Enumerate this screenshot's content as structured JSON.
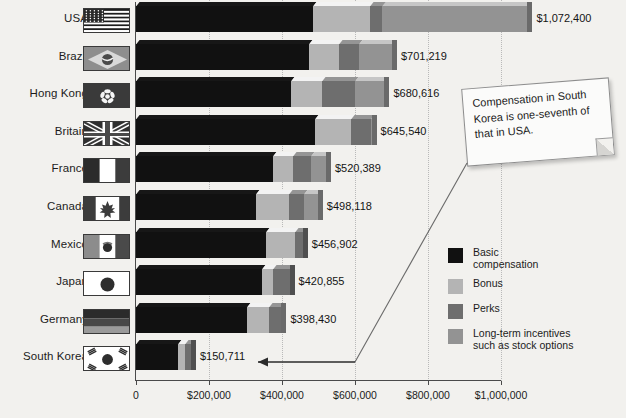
{
  "chart_data": {
    "type": "bar",
    "orientation": "horizontal",
    "stacked": true,
    "title": "",
    "xlabel": "",
    "ylabel": "",
    "xlim": [
      0,
      1000000
    ],
    "grid": true,
    "legend_position": "right",
    "xticks": [
      "0",
      "$200,000",
      "$400,000",
      "$600,000",
      "$800,000",
      "$1,000,000"
    ],
    "xtick_values": [
      0,
      200000,
      400000,
      600000,
      800000,
      1000000
    ],
    "categories": [
      "USA",
      "Brazil",
      "Hong Kong",
      "Britain",
      "France",
      "Canada",
      "Mexico",
      "Japan",
      "Germany",
      "South Korea"
    ],
    "totals": [
      1072400,
      701219,
      680616,
      645540,
      520389,
      498118,
      456902,
      420855,
      398430,
      150711
    ],
    "total_labels": [
      "$1,072,400",
      "$701,219",
      "$680,616",
      "$645,540",
      "$520,389",
      "$520,389",
      "$456,902",
      "$420,855",
      "$398,430",
      "$150,711"
    ],
    "value_labels": [
      "$1,072,400",
      "$701,219",
      "$680,616",
      "$645,540",
      "$520,389",
      "$498,118",
      "$456,902",
      "$420,855",
      "$398,430",
      "$150,711"
    ],
    "series": [
      {
        "name": "Basic compensation",
        "color": "#111111",
        "values": [
          485000,
          475000,
          425000,
          490000,
          375000,
          330000,
          355000,
          345000,
          305000,
          115000
        ]
      },
      {
        "name": "Bonus",
        "color": "#b4b4b4",
        "values": [
          155000,
          80000,
          85000,
          100000,
          55000,
          90000,
          80000,
          30000,
          60000,
          20000
        ]
      },
      {
        "name": "Perks",
        "color": "#6e6e6e",
        "values": [
          35000,
          55000,
          90000,
          55000,
          50000,
          40000,
          22000,
          46000,
          33000,
          16000
        ]
      },
      {
        "name": "Long-term incentives such as stock options",
        "color": "#939393",
        "values": [
          397400,
          91219,
          80616,
          540,
          40389,
          38118,
          0,
          0,
          430,
          0
        ]
      }
    ]
  },
  "legend": {
    "items": [
      {
        "label": "Basic\ncompensation",
        "label_line1": "Basic",
        "label_line2": "compensation",
        "color": "#111111"
      },
      {
        "label": "Bonus",
        "label_line1": "Bonus",
        "label_line2": "",
        "color": "#b4b4b4"
      },
      {
        "label": "Perks",
        "label_line1": "Perks",
        "label_line2": "",
        "color": "#6e6e6e"
      },
      {
        "label": "Long-term incentives such as stock options",
        "label_line1": "Long-term incentives",
        "label_line2": "such as stock options",
        "color": "#939393"
      }
    ]
  },
  "callout": {
    "text": "Compensation in South Korea is one-seventh of that in USA."
  },
  "flags": {
    "USA": "flag-usa-icon",
    "Brazil": "flag-brazil-icon",
    "Hong Kong": "flag-hongkong-icon",
    "Britain": "flag-britain-icon",
    "France": "flag-france-icon",
    "Canada": "flag-canada-icon",
    "Mexico": "flag-mexico-icon",
    "Japan": "flag-japan-icon",
    "Germany": "flag-germany-icon",
    "South Korea": "flag-southkorea-icon"
  },
  "colors": {
    "background": "#f2f1ee",
    "axis": "#4a4a4a",
    "grid": "#b9b9b9",
    "basic": "#111111",
    "bonus": "#b4b4b4",
    "perks": "#6e6e6e",
    "ltip": "#939393"
  }
}
